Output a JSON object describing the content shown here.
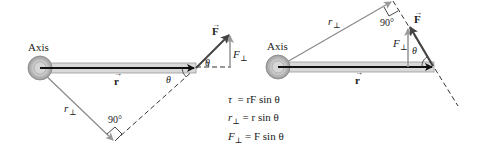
{
  "left_panel": {
    "axis_label": "Axis",
    "r_label": "r",
    "F_label": "F",
    "F_perp_label": "F",
    "r_perp_label": "r",
    "theta_label_1": "θ",
    "theta_label_2": "θ",
    "right_angle_label": "90°"
  },
  "right_panel": {
    "axis_label": "Axis",
    "r_label": "r",
    "F_label": "F",
    "F_perp_label": "F",
    "r_perp_label": "r",
    "theta_label": "θ",
    "right_angle_label": "90°"
  },
  "equations": [
    {
      "lhs": "τ",
      "lhs_sub": "",
      "rhs": "= rF sin θ"
    },
    {
      "lhs": "r",
      "lhs_sub": "⊥",
      "rhs": "= r sin θ"
    },
    {
      "lhs": "F",
      "lhs_sub": "⊥",
      "rhs": "= F sin θ"
    }
  ],
  "colors": {
    "rod_fill": "#d9d9d9",
    "rod_stroke": "#9a9a9a",
    "vector_dark": "#111111",
    "force_arrow": "#444444",
    "perp_component": "#9a9a9a",
    "r_perp_line": "#8a8a8a",
    "dashed": "#333333"
  }
}
